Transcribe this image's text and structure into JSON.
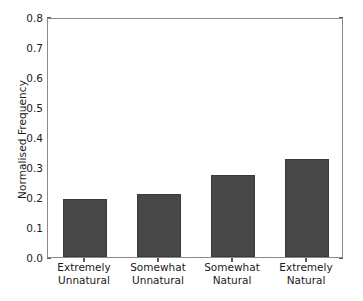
{
  "chart_data": {
    "type": "bar",
    "title": "",
    "xlabel": "",
    "ylabel": "Normalised Frequency",
    "categories": [
      "Extremely Unnatural",
      "Somewhat Unnatural",
      "Somewhat Natural",
      "Extremely Natural"
    ],
    "category_lines": [
      [
        "Extremely",
        "Unnatural"
      ],
      [
        "Somewhat",
        "Unnatural"
      ],
      [
        "Somewhat",
        "Natural"
      ],
      [
        "Extremely",
        "Natural"
      ]
    ],
    "values": [
      0.193,
      0.211,
      0.272,
      0.327
    ],
    "ylim": [
      0.0,
      0.8
    ],
    "ytick_labels": [
      "0.0",
      "0.1",
      "0.2",
      "0.3",
      "0.4",
      "0.5",
      "0.6",
      "0.7",
      "0.8"
    ],
    "ytick_values": [
      0.0,
      0.1,
      0.2,
      0.3,
      0.4,
      0.5,
      0.6,
      0.7,
      0.8
    ],
    "grid": false,
    "legend": null,
    "legend_position": "none",
    "bar_color": "#474747",
    "bar_edge_color": "#3a3a3a",
    "axis_color": "#8a8a8a",
    "text_color": "#1a1a1a",
    "background_color": "#ffffff"
  }
}
